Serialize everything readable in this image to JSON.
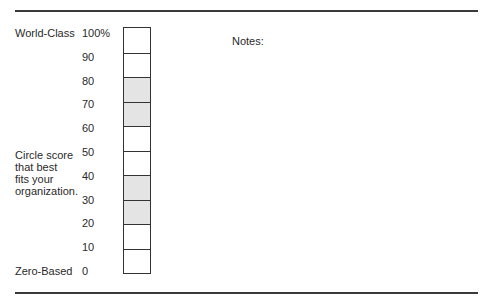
{
  "top_label": "World-Class",
  "bottom_label": "Zero-Based",
  "prompt_lines": [
    "Circle score",
    "that best",
    "fits your",
    "organization."
  ],
  "notes_label": "Notes:",
  "scale": {
    "ticks": [
      "100%",
      "90",
      "80",
      "70",
      "60",
      "50",
      "40",
      "30",
      "20",
      "10",
      "0"
    ],
    "cells": [
      {
        "range": "90-100",
        "shaded": false
      },
      {
        "range": "80-90",
        "shaded": false
      },
      {
        "range": "70-80",
        "shaded": true
      },
      {
        "range": "60-70",
        "shaded": true
      },
      {
        "range": "50-60",
        "shaded": false
      },
      {
        "range": "40-50",
        "shaded": false
      },
      {
        "range": "30-40",
        "shaded": true
      },
      {
        "range": "20-30",
        "shaded": true
      },
      {
        "range": "10-20",
        "shaded": false
      },
      {
        "range": "0-10",
        "shaded": false
      }
    ],
    "shade_color": "#e4e4e4"
  }
}
